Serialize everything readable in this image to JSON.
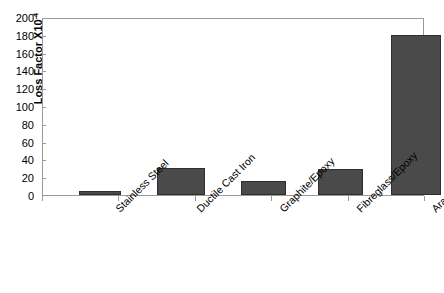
{
  "chart_data": {
    "type": "bar",
    "title": "",
    "xlabel": "",
    "ylabel": "Loss Factor X10",
    "ylabel_superscript": "-4",
    "categories": [
      "Stainless Steel",
      "Ductile Cast Iron",
      "Graphite/Epoxy",
      "Fibreglass/Epoxy",
      "Aramid/Epoxy"
    ],
    "values": [
      5,
      30,
      16,
      29,
      180
    ],
    "ylim": [
      0,
      200
    ],
    "ytick_step": 20,
    "yticks": [
      "200",
      "180",
      "160",
      "140",
      "120",
      "100",
      "80",
      "60",
      "40",
      "20",
      "0"
    ],
    "ytick_values": [
      200,
      180,
      160,
      140,
      120,
      100,
      80,
      60,
      40,
      20,
      0
    ],
    "grid": false,
    "legend": false,
    "bar_color": "#4a4a4a",
    "bar_edge_color": "#2e2e2e",
    "axis_color": "#9a9a9a",
    "background_color": "#ffffff",
    "text_color": "#000000",
    "xlabel_rotation_deg": -45,
    "bar_geometry": [
      {
        "left_px": 36,
        "width_px": 42
      },
      {
        "left_px": 114,
        "width_px": 48
      },
      {
        "left_px": 198,
        "width_px": 45
      },
      {
        "left_px": 275,
        "width_px": 45
      },
      {
        "left_px": 348,
        "width_px": 50
      }
    ],
    "tick_positions_px": [
      0,
      76,
      153,
      229,
      306,
      382
    ]
  }
}
